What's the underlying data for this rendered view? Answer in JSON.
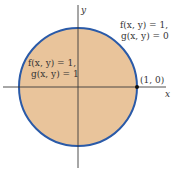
{
  "diagram": {
    "axes": {
      "x_label": "x",
      "y_label": "y",
      "color": "#3a3a3a"
    },
    "circle": {
      "fill": "#e9c49b",
      "stroke": "#2a5aa8"
    },
    "point": {
      "label": "(1, 0)",
      "color": "#111111"
    },
    "inside_region": {
      "line1": "f(x, y) = 1,",
      "line2": "g(x, y) = 1"
    },
    "boundary_region": {
      "line1": "f(x, y) = 1,",
      "line2": "g(x, y) = 0"
    }
  }
}
